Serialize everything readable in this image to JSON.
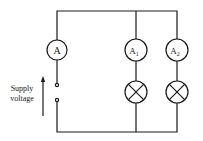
{
  "diagram": {
    "type": "circuit",
    "components": {
      "main_ammeter": {
        "label": "A"
      },
      "ammeter_1": {
        "label": "A",
        "subscript": "1"
      },
      "ammeter_2": {
        "label": "A",
        "subscript": "2"
      },
      "lamp_1": {
        "symbol": "lamp"
      },
      "lamp_2": {
        "symbol": "lamp"
      }
    },
    "supply": {
      "label_line1": "Supply",
      "label_line2": "voltage"
    },
    "colors": {
      "line": "#1a1a1a",
      "background": "#ffffff"
    }
  }
}
